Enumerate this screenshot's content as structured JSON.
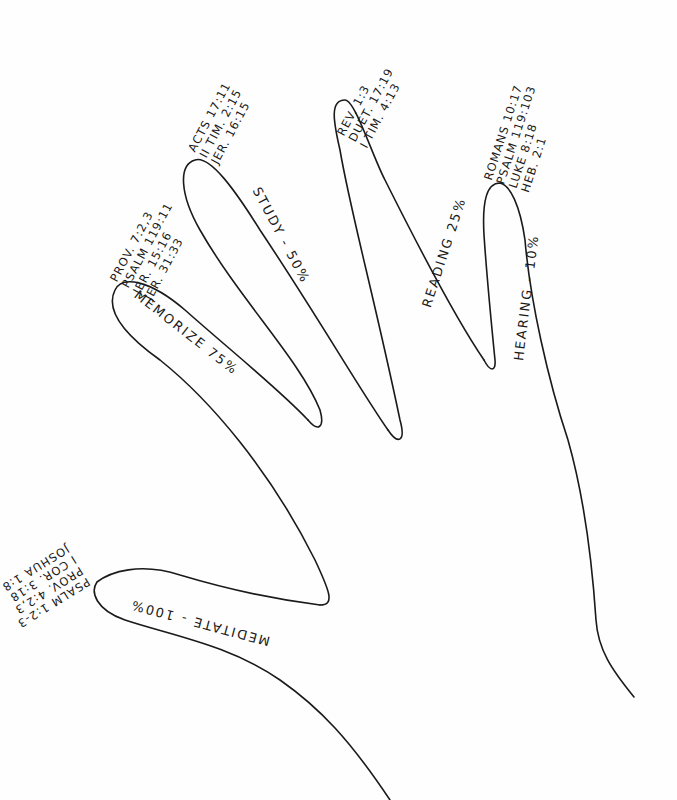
{
  "diagram": {
    "type": "hand-drawn hand outline",
    "stroke_color": "#1a1a1a",
    "background": "#fefefe",
    "fingers": [
      {
        "id": "hearing",
        "label": "HEARING - 10%",
        "references": [
          "ROMANS 10:17",
          "PSALM 119:103",
          "LUKE 8:18",
          "HEB. 2:1"
        ]
      },
      {
        "id": "reading",
        "label": "READING 25%",
        "references": [
          "REV. 1:3",
          "DUET. 17:19",
          "I TIM. 4:13"
        ]
      },
      {
        "id": "study",
        "label": "STUDY - 50%",
        "references": [
          "ACTS 17:11",
          "II TIM. 2:15",
          "JER. 16:15"
        ]
      },
      {
        "id": "memorize",
        "label": "MEMORIZE 75%",
        "references": [
          "PROV. 7:2,3",
          "PSALM 119:11",
          "JER. 15:16",
          "JER. 31:33"
        ]
      },
      {
        "id": "meditate",
        "label": "MEDITATE - 100%",
        "references": [
          "PSALM 1:2-3",
          "PROV. 4:2,3",
          "I COR. 3:18",
          "JOSHUA 1:8"
        ]
      }
    ]
  }
}
